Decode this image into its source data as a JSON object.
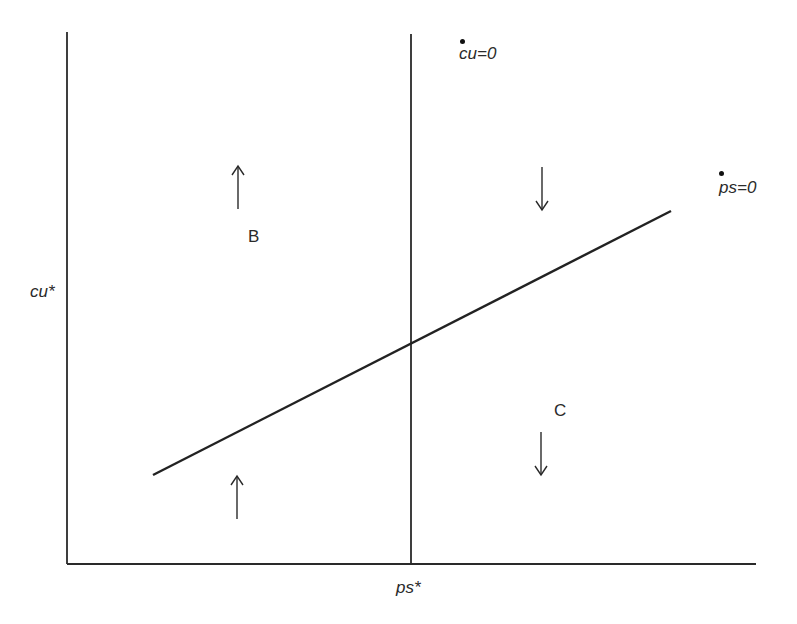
{
  "diagram": {
    "type": "phase-diagram",
    "axes": {
      "x_label": "ps*",
      "y_label": "cu*"
    },
    "lines": [
      {
        "name": "cu-dot-zero-locus",
        "label": "cu=0",
        "dot_notation": "time derivative",
        "orientation": "vertical",
        "at_x_label": "ps*"
      },
      {
        "name": "ps-dot-zero-locus",
        "label": "ps=0",
        "dot_notation": "time derivative",
        "orientation": "upward-sloping"
      }
    ],
    "regions": [
      {
        "label": "B",
        "position": "upper-left"
      },
      {
        "label": "C",
        "position": "lower-right"
      }
    ],
    "arrows": [
      {
        "direction": "up",
        "position": "upper-left"
      },
      {
        "direction": "up",
        "position": "lower-left"
      },
      {
        "direction": "down",
        "position": "upper-right"
      },
      {
        "direction": "down",
        "position": "lower-right"
      }
    ],
    "colors": {
      "line": "#2a2a2a",
      "background": "#ffffff"
    }
  },
  "labels": {
    "cu_zero": "cu=0",
    "ps_zero": "ps=0",
    "cu_star": "cu*",
    "ps_star": "ps*",
    "region_b": "B",
    "region_c": "C"
  }
}
